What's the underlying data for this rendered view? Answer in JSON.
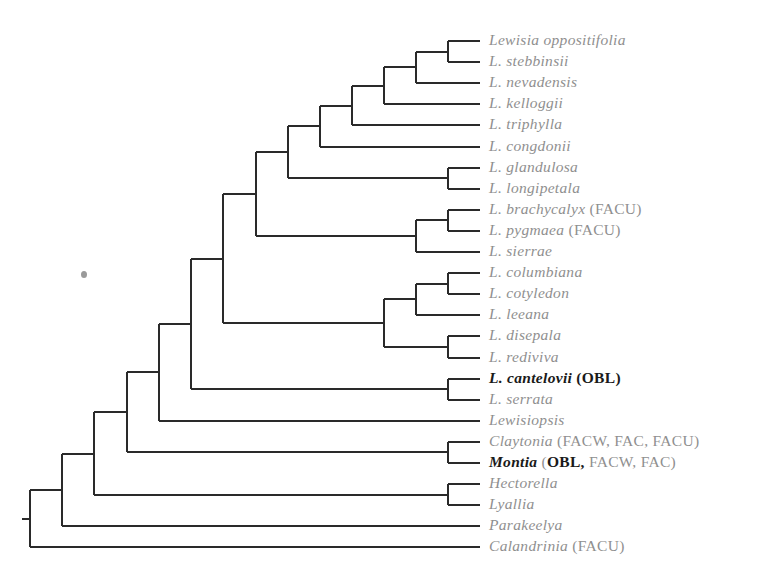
{
  "diagram": {
    "type": "phylogenetic-tree",
    "orientation": "left-to-right",
    "leaf_x": 480,
    "leaf_y0": 41,
    "leaf_dy": 21.1,
    "line_color": "#2a2a2a",
    "label_color": "#8f8f8f",
    "highlight_color": "#1a1a1a"
  },
  "leaves": [
    {
      "name": "Lewisia oppositifolia",
      "habit": "",
      "strong": false
    },
    {
      "name": "L. stebbinsii",
      "habit": "",
      "strong": false
    },
    {
      "name": "L. nevadensis",
      "habit": "",
      "strong": false
    },
    {
      "name": "L. kelloggii",
      "habit": "",
      "strong": false
    },
    {
      "name": "L. triphylla",
      "habit": "",
      "strong": false
    },
    {
      "name": "L. congdonii",
      "habit": "",
      "strong": false
    },
    {
      "name": "L. glandulosa",
      "habit": "",
      "strong": false
    },
    {
      "name": "L. longipetala",
      "habit": "",
      "strong": false
    },
    {
      "name": "L. brachycalyx",
      "habit": " (FACU)",
      "strong": false
    },
    {
      "name": "L. pygmaea",
      "habit": " (FACU)",
      "strong": false
    },
    {
      "name": "L. sierrae",
      "habit": "",
      "strong": false
    },
    {
      "name": "L. columbiana",
      "habit": "",
      "strong": false
    },
    {
      "name": "L. cotyledon",
      "habit": "",
      "strong": false
    },
    {
      "name": "L. leeana",
      "habit": "",
      "strong": false
    },
    {
      "name": "L. disepala",
      "habit": "",
      "strong": false
    },
    {
      "name": "L. rediviva",
      "habit": "",
      "strong": false
    },
    {
      "name": "L. cantelovii",
      "habit_strong": " (OBL)",
      "habit": "",
      "strong": true
    },
    {
      "name": "L. serrata",
      "habit": "",
      "strong": false
    },
    {
      "name": "Lewisiopsis",
      "habit": "",
      "strong": false
    },
    {
      "name": "Claytonia",
      "habit": " (FACW, FAC, FACU)",
      "strong": false
    },
    {
      "name": "Montia",
      "habit_prefix": " (",
      "habit_strong": "OBL,",
      "habit": " FACW, FAC)",
      "strong": true
    },
    {
      "name": "Hectorella",
      "habit": "",
      "strong": false
    },
    {
      "name": "Lyallia",
      "habit": "",
      "strong": false
    },
    {
      "name": "Parakeelya",
      "habit": "",
      "strong": false
    },
    {
      "name": "Calandrinia",
      "habit": " (FACU)",
      "strong": false
    }
  ],
  "nodes": [
    {
      "id": "A",
      "x": 448,
      "children": [
        "L0",
        "L1"
      ]
    },
    {
      "id": "B",
      "x": 416,
      "children": [
        "A",
        "L2"
      ]
    },
    {
      "id": "C",
      "x": 384,
      "children": [
        "B",
        "L3"
      ]
    },
    {
      "id": "D",
      "x": 352,
      "children": [
        "C",
        "L4"
      ]
    },
    {
      "id": "E",
      "x": 320,
      "children": [
        "D",
        "L5"
      ]
    },
    {
      "id": "F",
      "x": 448,
      "children": [
        "L6",
        "L7"
      ]
    },
    {
      "id": "G",
      "x": 288,
      "children": [
        "E",
        "F"
      ]
    },
    {
      "id": "H",
      "x": 448,
      "children": [
        "L8",
        "L9"
      ]
    },
    {
      "id": "I",
      "x": 416,
      "children": [
        "H",
        "L10"
      ]
    },
    {
      "id": "J",
      "x": 256,
      "children": [
        "G",
        "I"
      ]
    },
    {
      "id": "K",
      "x": 448,
      "children": [
        "L11",
        "L12"
      ]
    },
    {
      "id": "L",
      "x": 416,
      "children": [
        "K",
        "L13"
      ]
    },
    {
      "id": "M",
      "x": 448,
      "children": [
        "L14",
        "L15"
      ]
    },
    {
      "id": "N",
      "x": 384,
      "children": [
        "L",
        "M"
      ]
    },
    {
      "id": "O",
      "x": 223,
      "children": [
        "J",
        "N"
      ]
    },
    {
      "id": "P",
      "x": 448,
      "children": [
        "L16",
        "L17"
      ]
    },
    {
      "id": "Q",
      "x": 191,
      "children": [
        "O",
        "P"
      ]
    },
    {
      "id": "R",
      "x": 159,
      "children": [
        "Q",
        "L18"
      ]
    },
    {
      "id": "S",
      "x": 448,
      "children": [
        "L19",
        "L20"
      ]
    },
    {
      "id": "T",
      "x": 127,
      "children": [
        "R",
        "S"
      ]
    },
    {
      "id": "U",
      "x": 448,
      "children": [
        "L21",
        "L22"
      ]
    },
    {
      "id": "V",
      "x": 94,
      "children": [
        "T",
        "U"
      ]
    },
    {
      "id": "W",
      "x": 62,
      "children": [
        "V",
        "L23"
      ]
    },
    {
      "id": "X",
      "x": 30,
      "children": [
        "W",
        "L24"
      ],
      "root": true
    }
  ],
  "speck": {
    "x": 81,
    "y": 271
  }
}
